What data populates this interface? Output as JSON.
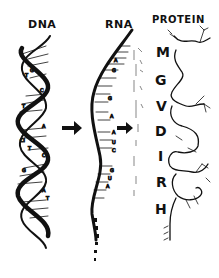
{
  "labels": {
    "dna": "DNA",
    "rna": "RNA",
    "protein": "PROTEIN"
  },
  "amino_acids": [
    {
      "letter": "M",
      "x": 156,
      "y": 44
    },
    {
      "letter": "G",
      "x": 155,
      "y": 72
    },
    {
      "letter": "V",
      "x": 156,
      "y": 98
    },
    {
      "letter": "D",
      "x": 155,
      "y": 123
    },
    {
      "letter": "I",
      "x": 156,
      "y": 148
    },
    {
      "letter": "R",
      "x": 156,
      "y": 174
    },
    {
      "letter": "H",
      "x": 155,
      "y": 201
    }
  ],
  "arrows": [
    "dna-to-rna",
    "rna-to-protein"
  ],
  "colors": {
    "ink": "#111111",
    "background": "#ffffff"
  }
}
